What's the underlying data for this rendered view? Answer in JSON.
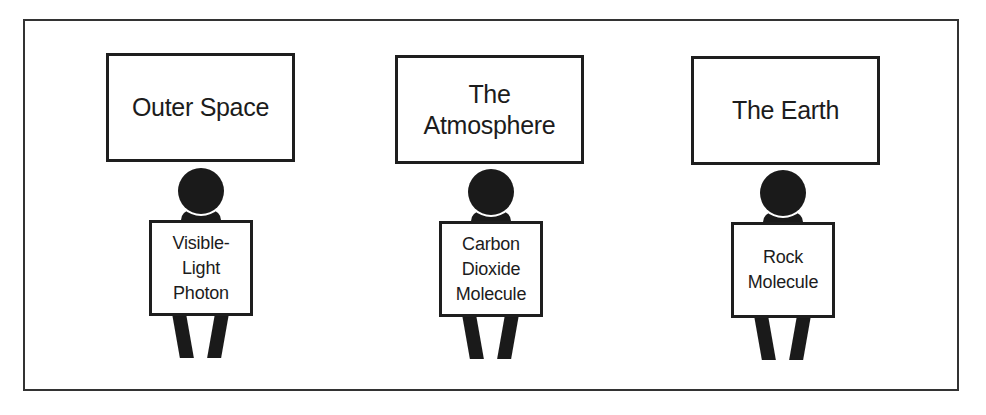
{
  "diagram": {
    "panels": [
      {
        "title": "The Outer Space",
        "title_display": "Outer Space",
        "sign": "Visible-\nLight\nPhoton"
      },
      {
        "title_display": "The\nAtmosphere",
        "sign": "Carbon\nDioxide\nMolecule"
      },
      {
        "title_display": "The Earth",
        "sign": "Rock\nMolecule"
      }
    ]
  },
  "colors": {
    "border": "#1e1e1e",
    "figure": "#1a1a1a",
    "frame": "#333333",
    "background": "#ffffff"
  }
}
